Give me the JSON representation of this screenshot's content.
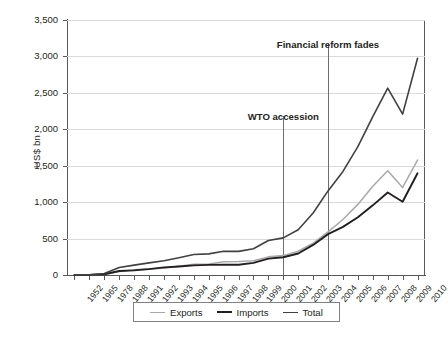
{
  "chart_data": {
    "type": "line",
    "title": "",
    "xlabel": "",
    "ylabel": "US$ bn",
    "ylim": [
      0,
      3500
    ],
    "yticks": [
      0,
      500,
      1000,
      1500,
      2000,
      2500,
      3000,
      3500
    ],
    "ytick_labels": [
      "0",
      "500",
      "1,000",
      "1,500",
      "2,000",
      "2,500",
      "3,000",
      "3,500"
    ],
    "grid": "horizontal",
    "legend_position": "bottom",
    "categories": [
      "1952",
      "1965",
      "1978",
      "1988",
      "1991",
      "1992",
      "1993",
      "1994",
      "1995",
      "1996",
      "1997",
      "1998",
      "1999",
      "2000",
      "2001",
      "2002",
      "2003",
      "2004",
      "2005",
      "2006",
      "2007",
      "2008",
      "2009",
      "2010"
    ],
    "series": [
      {
        "name": "Exports",
        "color": "#a7a9ac",
        "values": [
          1,
          2,
          10,
          48,
          72,
          85,
          92,
          121,
          149,
          151,
          183,
          184,
          195,
          249,
          266,
          326,
          438,
          593,
          762,
          969,
          1218,
          1431,
          1202,
          1578
        ]
      },
      {
        "name": "Imports",
        "color": "#231f20",
        "values": [
          1,
          2,
          11,
          55,
          64,
          81,
          104,
          116,
          132,
          139,
          142,
          140,
          166,
          225,
          244,
          295,
          413,
          561,
          660,
          792,
          956,
          1133,
          1006,
          1396
        ]
      },
      {
        "name": "Total",
        "color": "#414042",
        "values": [
          2,
          4,
          21,
          103,
          136,
          166,
          196,
          237,
          281,
          290,
          325,
          324,
          361,
          474,
          510,
          621,
          851,
          1154,
          1422,
          1761,
          2174,
          2564,
          2208,
          2974
        ]
      }
    ],
    "annotations": [
      {
        "text": "WTO accession",
        "at_category": "2001",
        "label_value": 2250,
        "line_top_value": 2180,
        "line_bottom_value": 0
      },
      {
        "text": "Financial reform fades",
        "at_category": "2004",
        "label_value": 3240,
        "line_top_value": 3170,
        "line_bottom_value": 0
      }
    ],
    "legend_entries": [
      {
        "label": "Exports",
        "swatch": "exports-line-swatch"
      },
      {
        "label": "Imports",
        "swatch": "imports-line-swatch"
      },
      {
        "label": "Total",
        "swatch": "total-line-swatch"
      }
    ]
  }
}
